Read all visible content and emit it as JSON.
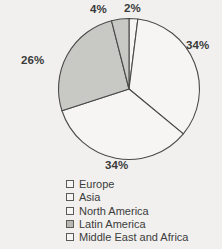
{
  "chart_data": {
    "type": "pie",
    "title": "",
    "subtitle": "",
    "xlabel": "",
    "ylabel": "",
    "grid": false,
    "legend_position": "bottom",
    "units": "percent",
    "categories": [
      "Europe",
      "Asia",
      "North America",
      "Latin America",
      "Middle East and Africa"
    ],
    "values": [
      34,
      34,
      26,
      4,
      2
    ],
    "slices": [
      {
        "label": "Europe",
        "value": 34,
        "data_label": "34%",
        "color": "#f6f5f3",
        "start_angle_deg": 7.2,
        "end_angle_deg": 129.6,
        "label_position": "right"
      },
      {
        "label": "Asia",
        "value": 34,
        "data_label": "34%",
        "color": "#f6f5f3",
        "start_angle_deg": 129.6,
        "end_angle_deg": 252.0,
        "label_position": "bottom"
      },
      {
        "label": "North America",
        "value": 26,
        "data_label": "26%",
        "color": "#c8c8c4",
        "start_angle_deg": 252.0,
        "end_angle_deg": 345.6,
        "label_position": "left"
      },
      {
        "label": "Latin America",
        "value": 4,
        "data_label": "4%",
        "color": "#c8c8c4",
        "start_angle_deg": 345.6,
        "end_angle_deg": 360.0,
        "label_position": "top-left"
      },
      {
        "label": "Middle East and Africa",
        "value": 2,
        "data_label": "2%",
        "color": "#f6f5f3",
        "start_angle_deg": 0.0,
        "end_angle_deg": 7.2,
        "label_position": "top"
      }
    ],
    "data_labels": {
      "europe": "34%",
      "asia": "34%",
      "north_america": "26%",
      "latin_america": "4%",
      "middle_east_and_africa": "2%"
    }
  },
  "legend": {
    "items": [
      {
        "label": "Europe",
        "color": "#f6f5f3"
      },
      {
        "label": "Asia",
        "color": "#f6f5f3"
      },
      {
        "label": "North America",
        "color": "#f6f5f3"
      },
      {
        "label": "Latin America",
        "color": "#b9b9b4"
      },
      {
        "label": "Middle East and Africa",
        "color": "#f6f5f3"
      }
    ]
  },
  "style": {
    "background": "#f1f0ee",
    "outline": "#4a4a4a",
    "text": "#3c3c3c",
    "fill_light": "#f6f5f3",
    "fill_gray": "#c8c8c4"
  }
}
